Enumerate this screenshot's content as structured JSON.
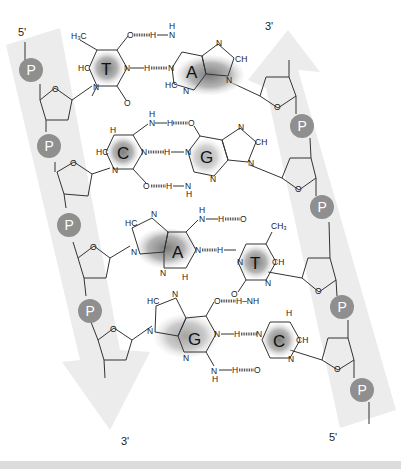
{
  "diagram": {
    "colors": {
      "backbone_band": "#ececec",
      "phosphate": "#8f8f8f",
      "base_shade": "#8a8a8a",
      "bottom_band": "#dcdcdc"
    },
    "strand_left": {
      "top_label": "5'",
      "bottom_label": "3'",
      "phosphate_label": "P",
      "direction": "down"
    },
    "strand_right": {
      "top_label": "3'",
      "bottom_label": "5'",
      "phosphate_label": "P",
      "direction": "up"
    },
    "base_pairs": [
      {
        "left": "T",
        "right": "A",
        "hydrogen_bonds": 2
      },
      {
        "left": "C",
        "right": "G",
        "hydrogen_bonds": 3
      },
      {
        "left": "A",
        "right": "T",
        "hydrogen_bonds": 2
      },
      {
        "left": "G",
        "right": "C",
        "hydrogen_bonds": 3
      }
    ],
    "atoms": {
      "H3C": "H3C",
      "CH3": "CH3",
      "HC": "HC",
      "CH": "CH",
      "C": "C",
      "N": "N",
      "O": "O",
      "H": "H",
      "NH": "NH",
      "H_N": "H–N"
    }
  }
}
